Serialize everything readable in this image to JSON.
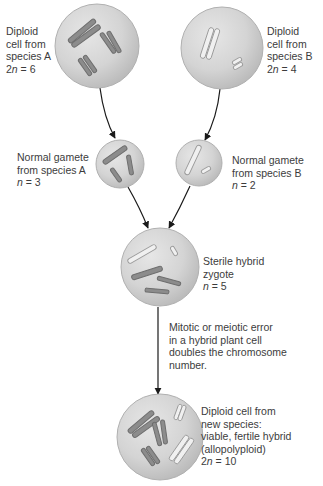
{
  "diagram": {
    "type": "allopolyploid speciation",
    "colors": {
      "cell_fill": "#d2d2d2",
      "cell_edge": "#a8a8a8",
      "chromosome_A": "#8a8a8a",
      "chromosome_B": "#ededed",
      "arrow": "#1a1a1a",
      "text": "#3c3c3c"
    },
    "cells": [
      {
        "id": "diploid-a",
        "lines": [
          "Diploid",
          "cell from",
          "species A"
        ],
        "ploidy_prefix": "2",
        "ploidy_var": "n",
        "ploidy_suffix": " = 6"
      },
      {
        "id": "diploid-b",
        "lines": [
          "Diploid",
          "cell from",
          "species B"
        ],
        "ploidy_prefix": "2",
        "ploidy_var": "n",
        "ploidy_suffix": " = 4"
      },
      {
        "id": "gamete-a",
        "lines": [
          "Normal gamete",
          "from species A"
        ],
        "ploidy_prefix": "",
        "ploidy_var": "n",
        "ploidy_suffix": " = 3"
      },
      {
        "id": "gamete-b",
        "lines": [
          "Normal gamete",
          "from species B"
        ],
        "ploidy_prefix": "",
        "ploidy_var": "n",
        "ploidy_suffix": " = 2"
      },
      {
        "id": "hybrid-zygote",
        "lines": [
          "Sterile hybrid",
          "zygote"
        ],
        "ploidy_prefix": "",
        "ploidy_var": "n",
        "ploidy_suffix": " = 5"
      },
      {
        "id": "new-species",
        "lines": [
          "Diploid cell from",
          "new species:",
          "viable, fertile hybrid",
          "(allopolyploid)"
        ],
        "ploidy_prefix": "2",
        "ploidy_var": "n",
        "ploidy_suffix": " = 10"
      }
    ],
    "process_note": {
      "lines": [
        "Mitotic or meiotic error",
        "in a hybrid plant cell",
        "doubles the chromosome",
        "number."
      ]
    }
  }
}
